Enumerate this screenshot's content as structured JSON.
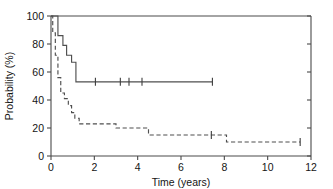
{
  "chart_data": {
    "type": "line",
    "title": "",
    "subtitle": "",
    "xlabel": "Time (years)",
    "ylabel": "Probability (%)",
    "xlim": [
      0,
      12
    ],
    "ylim": [
      0,
      100
    ],
    "xticks": [
      0,
      2,
      4,
      6,
      8,
      10,
      12
    ],
    "xtick_labels": [
      "0",
      "2",
      "4",
      "6",
      "8",
      "10",
      "12"
    ],
    "yticks": [
      0,
      20,
      40,
      60,
      80,
      100
    ],
    "ytick_labels": [
      "0",
      "20",
      "40",
      "60",
      "80",
      "100"
    ],
    "grid": false,
    "legend": "none",
    "frame": "box-right-ticks",
    "series": [
      {
        "name": "solid-curve",
        "style": "solid",
        "step": "post",
        "color": "#4f4f4f",
        "x": [
          0,
          0.32,
          0.32,
          0.55,
          0.55,
          0.72,
          0.72,
          0.95,
          0.95,
          1.15,
          1.15,
          7.45
        ],
        "y": [
          100,
          100,
          86,
          86,
          79,
          79,
          72,
          72,
          67,
          67,
          53,
          53
        ],
        "censor_x": [
          2.05,
          3.2,
          3.6,
          4.2,
          7.45
        ],
        "censor_y": [
          53,
          53,
          53,
          53,
          53
        ]
      },
      {
        "name": "dashed-curve",
        "style": "dashed",
        "step": "post",
        "color": "#4f4f4f",
        "x": [
          0,
          0.08,
          0.08,
          0.2,
          0.2,
          0.32,
          0.32,
          0.45,
          0.45,
          0.62,
          0.62,
          0.8,
          0.8,
          0.95,
          0.95,
          1.1,
          1.1,
          1.3,
          1.3,
          3.0,
          3.0,
          4.5,
          4.5,
          8.1,
          8.1,
          11.5
        ],
        "y": [
          100,
          100,
          88,
          88,
          72,
          72,
          56,
          56,
          45,
          45,
          41,
          41,
          36,
          36,
          31,
          31,
          27,
          27,
          23,
          23,
          20,
          20,
          15,
          15,
          10,
          10
        ],
        "censor_x": [
          7.4,
          11.5
        ],
        "censor_y": [
          15,
          10
        ]
      }
    ]
  },
  "axes": {
    "y_label": "Probability (%)",
    "x_label": "Time (years)"
  }
}
